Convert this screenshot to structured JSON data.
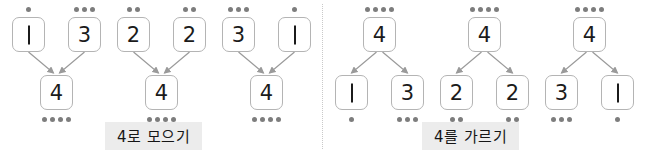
{
  "page": {
    "divider_icon": "vertical-dotted-divider",
    "arrowhead_icon": "arrowhead"
  },
  "colors": {
    "card_border": "#b4b4b4",
    "card_fill": "#ffffff",
    "pip": "#7d7d7d",
    "connector": "#9a9a9a",
    "caption_background": "#ececec",
    "text": "#1b1b1b",
    "divider": "#c9c9c9"
  },
  "panels": [
    {
      "id": "compose",
      "caption": "4로 모으기",
      "direction": "up",
      "groups": [
        {
          "id": "compose-1-3",
          "top": {
            "value": "4",
            "pips": 4
          },
          "parts": [
            {
              "value": "1",
              "pips": 1
            },
            {
              "value": "3",
              "pips": 3
            }
          ]
        },
        {
          "id": "compose-2-2",
          "top": {
            "value": "4",
            "pips": 4
          },
          "parts": [
            {
              "value": "2",
              "pips": 2
            },
            {
              "value": "2",
              "pips": 2
            }
          ]
        },
        {
          "id": "compose-3-1",
          "top": {
            "value": "4",
            "pips": 4
          },
          "parts": [
            {
              "value": "3",
              "pips": 3
            },
            {
              "value": "1",
              "pips": 1
            }
          ]
        }
      ]
    },
    {
      "id": "decompose",
      "caption": "4를 가르기",
      "direction": "down",
      "groups": [
        {
          "id": "decompose-1-3",
          "top": {
            "value": "4",
            "pips": 4
          },
          "parts": [
            {
              "value": "1",
              "pips": 1
            },
            {
              "value": "3",
              "pips": 3
            }
          ]
        },
        {
          "id": "decompose-2-2",
          "top": {
            "value": "4",
            "pips": 4
          },
          "parts": [
            {
              "value": "2",
              "pips": 2
            },
            {
              "value": "2",
              "pips": 2
            }
          ]
        },
        {
          "id": "decompose-3-1",
          "top": {
            "value": "4",
            "pips": 4
          },
          "parts": [
            {
              "value": "3",
              "pips": 3
            },
            {
              "value": "1",
              "pips": 1
            }
          ]
        }
      ]
    }
  ]
}
